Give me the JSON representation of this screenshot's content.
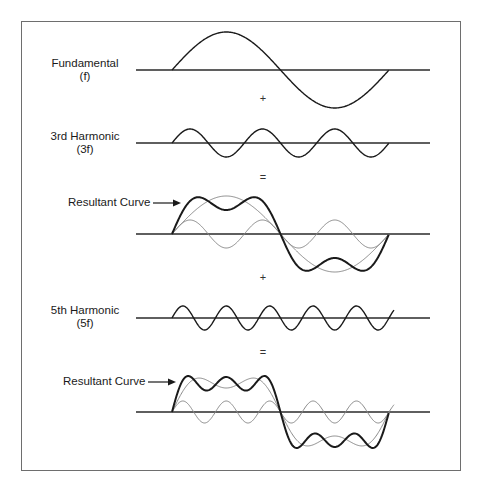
{
  "diagram": {
    "colors": {
      "frame": "#6e6e6e",
      "axis": "#2a2a2a",
      "primary_curve": "#1a1a1a",
      "component_curve": "#8a8a8a"
    },
    "x_start": 172,
    "x_end": 389,
    "axis_x_start": 136,
    "axis_x_end": 430,
    "rows": [
      {
        "id": "fundamental",
        "label_line1": "Fundamental",
        "label_line2": "(f)",
        "axis_y": 70,
        "curves": [
          {
            "kind": "primary",
            "harmonics": [
              [
                1,
                38
              ]
            ]
          }
        ]
      },
      {
        "id": "third-harmonic",
        "label_line1": "3rd Harmonic",
        "label_line2": "(3f)",
        "axis_y": 143,
        "curves": [
          {
            "kind": "primary",
            "harmonics": [
              [
                3,
                14
              ]
            ]
          }
        ]
      },
      {
        "id": "resultant-1",
        "label": "Resultant Curve",
        "axis_y": 234,
        "curves": [
          {
            "kind": "component",
            "harmonics": [
              [
                1,
                38
              ]
            ]
          },
          {
            "kind": "component",
            "harmonics": [
              [
                3,
                14
              ]
            ]
          },
          {
            "kind": "primary",
            "harmonics": [
              [
                1,
                38
              ],
              [
                3,
                14
              ]
            ]
          }
        ]
      },
      {
        "id": "fifth-harmonic",
        "label_line1": "5th Harmonic",
        "label_line2": "(5f)",
        "axis_y": 318,
        "x_end": 394,
        "curves": [
          {
            "kind": "primary",
            "harmonics": [
              [
                5,
                12
              ]
            ]
          }
        ]
      },
      {
        "id": "resultant-2",
        "label": "Resultant Curve",
        "axis_y": 412,
        "curves": [
          {
            "kind": "component",
            "harmonics": [
              [
                1,
                36
              ],
              [
                3,
                12
              ]
            ]
          },
          {
            "kind": "component",
            "harmonics": [
              [
                5,
                11
              ]
            ],
            "x_end": 394
          },
          {
            "kind": "primary",
            "harmonics": [
              [
                1,
                36
              ],
              [
                3,
                12
              ],
              [
                5,
                11
              ]
            ]
          }
        ]
      }
    ],
    "operators": [
      {
        "symbol": "+",
        "x": 263,
        "y": 99
      },
      {
        "symbol": "=",
        "x": 263,
        "y": 178
      },
      {
        "symbol": "+",
        "x": 263,
        "y": 278
      },
      {
        "symbol": "=",
        "x": 263,
        "y": 353
      }
    ]
  }
}
